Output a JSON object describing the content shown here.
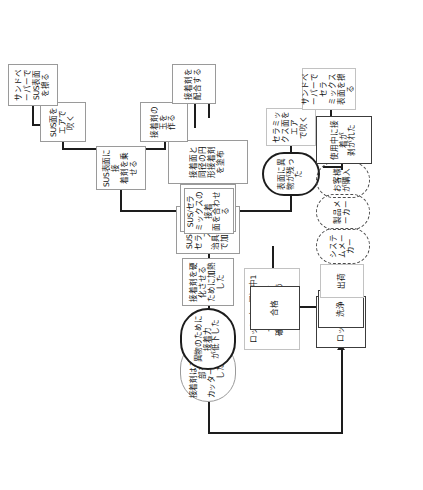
{
  "diagram": {
    "orientation": "rotated-90-ccw",
    "nodes": {
      "adhesive_trim": "接着剤はみ出し部を\nカッターで除去した",
      "foreign_matter_strength": "異物のために接着力\nが低下した",
      "heat_cure": "接着剤を硬化させる\nために加熱した",
      "press_jig": "SUS金具とセラミックスを\n治具で挟んで加圧した",
      "mate_parts": "SUS金具とセラミック\nスを合わせた",
      "apply_circle": "接着面と同径の円形接着剤を塗布",
      "align_faces": "SUS/セラミックスの接着\n面を合わせる",
      "put_adhesive_sus": "SUS表面に接\n着剤を乗せる",
      "air_blow_sus": "SUS面をエアで\n吹く",
      "sand_sus": "サンドペーパーで\nSUS表面を擦る",
      "make_ball": "接着剤の玉を\n作る",
      "mix_adhesive": "接着剤を\n配合する",
      "debris_left": "表面に異物が残った",
      "air_blow_ceramic": "セラミックス面をエア\nで吹く",
      "sand_ceramic": "サンドペーパーでセラ\nミックス表面を擦る",
      "lot_test": "ロット（11個）中1個\nで接着剤強度\n確認試験を行う(300N)",
      "pass": "合格",
      "lot_pass": "ロット合格",
      "wash": "洗浄",
      "ship": "出荷",
      "system_maker": "システムメーカー",
      "product_maker": "製品メーカー",
      "customer_buy": "お客様が購入",
      "peeled_in_use": "使用中に接着が\n剥がれた"
    },
    "colors": {
      "line": "#1d1d1d",
      "box_border": "#9a9a9a",
      "box_border_strong": "#3c3c3c",
      "background": "#ffffff",
      "text": "#111111"
    }
  }
}
